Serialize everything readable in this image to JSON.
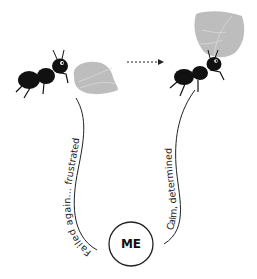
{
  "diagram": {
    "left_state": {
      "label": "Failed again... frustrated",
      "figure": "ant beside leaf"
    },
    "right_state": {
      "label": "Calm, determined",
      "figure": "ant carrying leaf"
    },
    "center": {
      "label": "ME"
    },
    "arrow": "dotted arrow pointing right",
    "colors": {
      "ant": "#111111",
      "leaf": "#bdbdbd",
      "line": "#222222",
      "background": "#ffffff"
    }
  }
}
